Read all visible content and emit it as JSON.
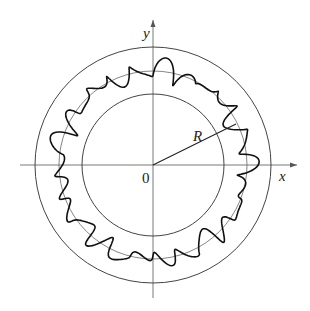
{
  "diagram": {
    "axis_labels": {
      "x": "x",
      "y": "y"
    },
    "origin_label": "0",
    "radius_label": "R",
    "elements": [
      "outer circle",
      "inner circle",
      "reference circle of radius R",
      "wavy closed curve fluctuating around circle R",
      "radius line from origin labelled R"
    ],
    "colors": {
      "line": "#333333",
      "curve": "#111111",
      "background": "#ffffff"
    }
  }
}
